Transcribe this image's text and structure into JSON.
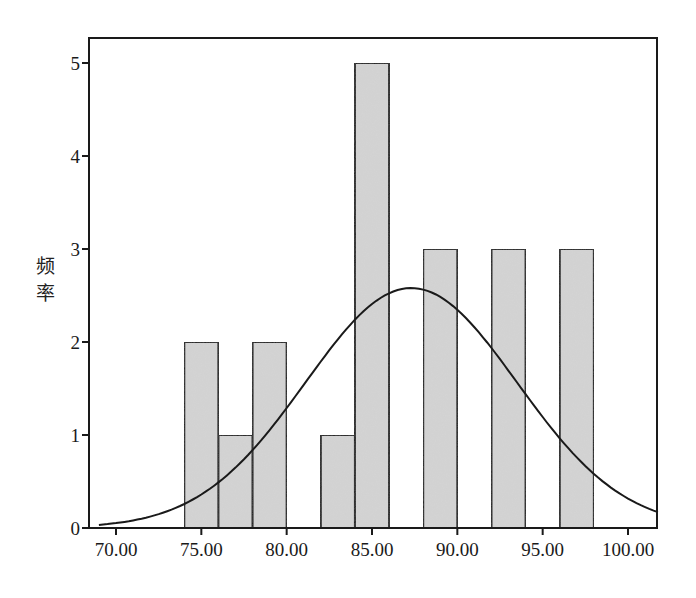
{
  "chart_data": {
    "type": "bar",
    "subtype": "histogram_with_normal_curve",
    "title": "",
    "xlabel": "",
    "ylabel": "频率",
    "xlim": [
      68.4,
      102.0
    ],
    "ylim": [
      0,
      5.3
    ],
    "x_ticks": [
      70,
      75,
      80,
      85,
      90,
      95,
      100
    ],
    "x_tick_labels": [
      "70.00",
      "75.00",
      "80.00",
      "85.00",
      "90.00",
      "95.00",
      "100.00"
    ],
    "y_ticks": [
      0,
      1,
      2,
      3,
      4,
      5
    ],
    "y_tick_labels": [
      "0",
      "1",
      "2",
      "3",
      "4",
      "5"
    ],
    "bin_width": 2,
    "bins": [
      {
        "start": 74,
        "end": 76,
        "count": 2
      },
      {
        "start": 76,
        "end": 78,
        "count": 1
      },
      {
        "start": 78,
        "end": 80,
        "count": 2
      },
      {
        "start": 82,
        "end": 84,
        "count": 1
      },
      {
        "start": 84,
        "end": 86,
        "count": 5
      },
      {
        "start": 88,
        "end": 90,
        "count": 3
      },
      {
        "start": 92,
        "end": 94,
        "count": 3
      },
      {
        "start": 96,
        "end": 98,
        "count": 3
      }
    ],
    "categories": [
      "74-76",
      "76-78",
      "78-80",
      "82-84",
      "84-86",
      "88-90",
      "92-94",
      "96-98"
    ],
    "values": [
      2,
      1,
      2,
      1,
      5,
      3,
      3,
      3
    ],
    "total_n": 20,
    "normal_curve": {
      "mean": 87.3,
      "std": 6.2,
      "peak_frequency": 2.58
    },
    "grid": false,
    "legend": null,
    "colors": {
      "bar_fill": "#d4d4d4",
      "bar_edge": "#1a1a1a",
      "curve": "#1a1a1a",
      "axis": "#1a1a1a"
    }
  }
}
